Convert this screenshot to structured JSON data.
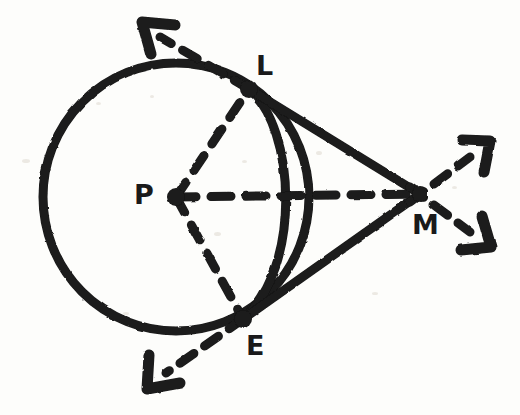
{
  "figure": {
    "background_color": "#fdfdfb",
    "ink_color": "#1a1a1a",
    "width": 520,
    "height": 415
  },
  "points": [
    {
      "id": "P",
      "label": "P",
      "role": "circle-center",
      "x": 176,
      "y": 197,
      "label_x": 134,
      "label_y": 181,
      "dot": true,
      "dot_r": 9
    },
    {
      "id": "L",
      "label": "L",
      "role": "tangent-point-upper",
      "x": 249,
      "y": 89,
      "label_x": 256,
      "label_y": 52,
      "dot": true,
      "dot_r": 9
    },
    {
      "id": "E",
      "label": "E",
      "role": "tangent-point-lower",
      "x": 243,
      "y": 319,
      "label_x": 246,
      "label_y": 332,
      "dot": true,
      "dot_r": 9
    },
    {
      "id": "M",
      "label": "M",
      "role": "external-point",
      "x": 420,
      "y": 194,
      "label_x": 412,
      "label_y": 211,
      "dot": true,
      "dot_r": 8
    }
  ],
  "circle": {
    "name": "circle-P",
    "center_x": 176,
    "center_y": 197,
    "radius": 133,
    "stroke_width": 9,
    "style": "solid"
  },
  "arc": {
    "name": "arc-LE-near",
    "note": "inner arc from L to E bulging to the right toward M",
    "from": "L",
    "to": "E",
    "rx": 70,
    "ry": 118,
    "stroke_width": 9,
    "style": "solid"
  },
  "segments": [
    {
      "name": "segment-LM",
      "from": "L",
      "to": "M",
      "style": "solid",
      "stroke_width": 9
    },
    {
      "name": "segment-EM",
      "from": "E",
      "to": "M",
      "style": "solid",
      "stroke_width": 9
    },
    {
      "name": "radius-PL",
      "from": "P",
      "to": "L",
      "style": "dashed",
      "stroke_width": 9
    },
    {
      "name": "radius-PE",
      "from": "P",
      "to": "E",
      "style": "dashed",
      "stroke_width": 9
    },
    {
      "name": "segment-PM",
      "from": "P",
      "to": "M",
      "style": "dashed",
      "stroke_width": 9
    }
  ],
  "rays": [
    {
      "name": "ray-tangent-upper-left",
      "note": "tangent line through L continuing up-left past the circle",
      "from_x": 249,
      "from_y": 89,
      "to_x": 152,
      "to_y": 32,
      "style": "dashed",
      "stroke_width": 9,
      "arrowhead": true
    },
    {
      "name": "ray-tangent-lower-left",
      "note": "tangent line through E continuing down-left past the circle",
      "from_x": 243,
      "from_y": 319,
      "to_x": 158,
      "to_y": 378,
      "style": "dashed",
      "stroke_width": 9,
      "arrowhead": true
    },
    {
      "name": "ray-from-M-upper-right",
      "note": "tangent line continuing up-right past M",
      "from_x": 420,
      "from_y": 194,
      "to_x": 478,
      "to_y": 150,
      "style": "dashed",
      "stroke_width": 9,
      "arrowhead": true
    },
    {
      "name": "ray-from-M-lower-right",
      "note": "tangent line continuing down-right past M",
      "from_x": 420,
      "from_y": 194,
      "to_x": 479,
      "to_y": 238,
      "style": "dashed",
      "stroke_width": 9,
      "arrowhead": true
    }
  ],
  "dash_pattern": "18 14",
  "specks": [
    {
      "x": 22,
      "y": 159,
      "w": 8,
      "h": 4
    },
    {
      "x": 96,
      "y": 102,
      "w": 5,
      "h": 3
    },
    {
      "x": 316,
      "y": 151,
      "w": 6,
      "h": 4
    },
    {
      "x": 242,
      "y": 160,
      "w": 5,
      "h": 3
    },
    {
      "x": 214,
      "y": 232,
      "w": 7,
      "h": 4
    },
    {
      "x": 372,
      "y": 292,
      "w": 6,
      "h": 3
    },
    {
      "x": 150,
      "y": 95,
      "w": 4,
      "h": 3
    },
    {
      "x": 452,
      "y": 186,
      "w": 5,
      "h": 3
    },
    {
      "x": 123,
      "y": 312,
      "w": 6,
      "h": 3
    }
  ]
}
